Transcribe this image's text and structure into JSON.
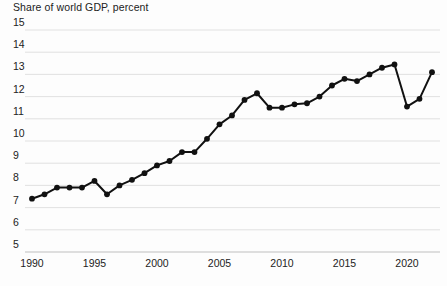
{
  "chart_data": {
    "type": "line",
    "title": "Share of world GDP, percent",
    "xlabel": "",
    "ylabel": "",
    "ylim": [
      5,
      15
    ],
    "xlim": [
      1990,
      2022
    ],
    "grid": true,
    "legend": "none",
    "y_ticks": [
      "15",
      "14",
      "13",
      "12",
      "11",
      "10",
      "9",
      "8",
      "7",
      "6",
      "5"
    ],
    "y_tick_values": [
      15,
      14,
      13,
      12,
      11,
      10,
      9,
      8,
      7,
      6,
      5
    ],
    "x_ticks": [
      "1990",
      "1995",
      "2000",
      "2005",
      "2010",
      "2015",
      "2020"
    ],
    "x_tick_values": [
      1990,
      1995,
      2000,
      2005,
      2010,
      2015,
      2020
    ],
    "marker": "circle",
    "line_color": "#111111",
    "marker_color": "#111111",
    "grid_color": "#d9d9d9",
    "background_color": "#fdfdfd",
    "x": [
      1990,
      1991,
      1992,
      1993,
      1994,
      1995,
      1996,
      1997,
      1998,
      1999,
      2000,
      2001,
      2002,
      2003,
      2004,
      2005,
      2006,
      2007,
      2008,
      2009,
      2010,
      2011,
      2012,
      2013,
      2014,
      2015,
      2016,
      2017,
      2018,
      2019,
      2020,
      2021,
      2022
    ],
    "values": [
      7.4,
      7.6,
      7.9,
      7.9,
      7.9,
      8.2,
      7.6,
      8.0,
      8.25,
      8.55,
      8.9,
      9.1,
      9.5,
      9.5,
      10.1,
      10.75,
      11.15,
      11.85,
      12.15,
      11.5,
      11.5,
      11.65,
      11.7,
      12.0,
      12.5,
      12.8,
      12.7,
      13.0,
      13.3,
      13.45,
      11.55,
      11.9,
      13.1
    ],
    "series": [
      {
        "name": "Share of world GDP",
        "values": [
          7.4,
          7.6,
          7.9,
          7.9,
          7.9,
          8.2,
          7.6,
          8.0,
          8.25,
          8.55,
          8.9,
          9.1,
          9.5,
          9.5,
          10.1,
          10.75,
          11.15,
          11.85,
          12.15,
          11.5,
          11.5,
          11.65,
          11.7,
          12.0,
          12.5,
          12.8,
          12.7,
          13.0,
          13.3,
          13.45,
          11.55,
          11.9,
          13.1
        ]
      }
    ]
  }
}
